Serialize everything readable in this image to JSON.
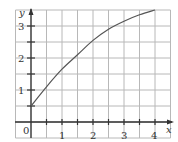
{
  "chart_data": {
    "type": "line",
    "title": "",
    "xlabel": "x",
    "ylabel": "y",
    "xlim": [
      -0.5,
      4.5
    ],
    "ylim": [
      -0.5,
      3.5
    ],
    "grid": true,
    "grid_step": 0.5,
    "x_ticks": [
      "0",
      "1",
      "2",
      "3",
      "4"
    ],
    "y_ticks": [
      "1",
      "2",
      "3"
    ],
    "origin_label": "0",
    "series": [
      {
        "name": "curve",
        "x": [
          0,
          0.5,
          1,
          1.5,
          2,
          2.5,
          3,
          3.5,
          4
        ],
        "y": [
          0.5,
          1.1,
          1.65,
          2.1,
          2.55,
          2.9,
          3.15,
          3.35,
          3.5
        ]
      }
    ],
    "colors": {
      "grid": "#b8b8b8",
      "axis": "#333333",
      "curve": "#555555"
    }
  }
}
